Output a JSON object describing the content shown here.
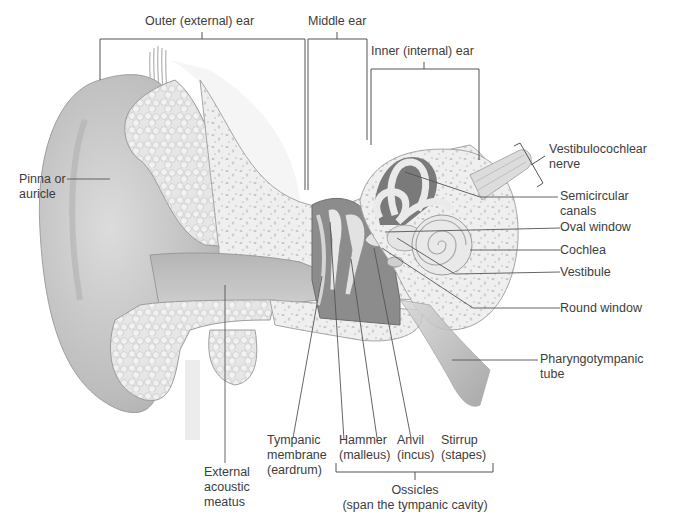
{
  "diagram": {
    "regions": {
      "outer": "Outer (external) ear",
      "middle": "Middle ear",
      "inner": "Inner (internal) ear"
    },
    "labels": {
      "pinna": "Pinna or\nauricle",
      "vestibulocochlear_nerve": "Vestibulocochlear\nnerve",
      "semicircular_canals": "Semicircular\ncanals",
      "oval_window": "Oval window",
      "cochlea": "Cochlea",
      "vestibule": "Vestibule",
      "round_window": "Round window",
      "pharyngotympanic_tube": "Pharyngotympanic\ntube",
      "external_acoustic_meatus": "External\nacoustic\nmeatus",
      "tympanic_membrane": "Tympanic\nmembrane\n(eardrum)",
      "hammer": "Hammer\n(malleus)",
      "anvil": "Anvil\n(incus)",
      "stirrup": "Stirrup\n(stapes)",
      "ossicles": "Ossicles\n(span the tympanic cavity)"
    },
    "colors": {
      "line": "#555555",
      "skin": "#c9c9c9",
      "bone": "#eeeeee",
      "cavity": "#8a8a8a",
      "text": "#3d3d3d"
    }
  }
}
